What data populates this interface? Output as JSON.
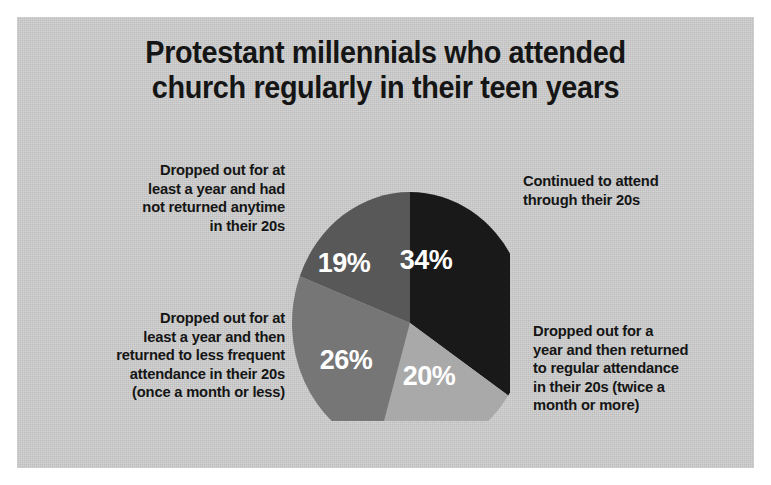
{
  "title": {
    "line1": "Protestant millennials who attended",
    "line2": "church regularly in their teen years"
  },
  "labels": {
    "top_left": {
      "l1": "Dropped out for at",
      "l2": "least a year and had",
      "l3": "not returned anytime",
      "l4": "in their 20s"
    },
    "bottom_left": {
      "l1": "Dropped out for at",
      "l2": "least a year and then",
      "l3": "returned to less frequent",
      "l4": "attendance in their 20s",
      "l5": "(once a month or less)"
    },
    "top_right": {
      "l1": "Continued to attend",
      "l2": "through their 20s"
    },
    "bottom_right": {
      "l1": "Dropped out for a",
      "l2": "year and then returned",
      "l3": "to regular attendance",
      "l4": "in their 20s (twice a",
      "l5": "month or more)"
    }
  },
  "chart_data": {
    "type": "pie",
    "title": "Protestant millennials who attended church regularly in their teen years",
    "start_angle_deg": 0,
    "direction": "clockwise",
    "legend_position": "callouts-around-pie",
    "categories": [
      "Continued to attend through their 20s",
      "Dropped out for a year and then returned to regular attendance in their 20s (twice a month or more)",
      "Dropped out for at least a year and then returned to less frequent attendance in their 20s (once a month or less)",
      "Dropped out for at least a year and had not returned anytime in their 20s"
    ],
    "values": [
      34,
      20,
      26,
      19
    ],
    "value_labels": [
      "34%",
      "20%",
      "26%",
      "19%"
    ],
    "colors": [
      "#191919",
      "#a9a9a9",
      "#767676",
      "#585858"
    ],
    "units": "percent",
    "total": 99
  },
  "slices": [
    {
      "name": "continued-to-attend",
      "label": "34%",
      "value": 34,
      "color": "#191919",
      "label_x": 152,
      "label_y": 103
    },
    {
      "name": "returned-regular-attendance",
      "label": "20%",
      "value": 20,
      "color": "#a9a9a9",
      "label_x": 155,
      "label_y": 219
    },
    {
      "name": "returned-less-frequent-attendance",
      "label": "26%",
      "value": 26,
      "color": "#767676",
      "label_x": 72,
      "label_y": 203
    },
    {
      "name": "never-returned",
      "label": "19%",
      "value": 19,
      "color": "#585858",
      "label_x": 70,
      "label_y": 106
    }
  ],
  "geometry": {
    "cx": 136,
    "cy": 164,
    "rx": 118,
    "ry": 131
  }
}
